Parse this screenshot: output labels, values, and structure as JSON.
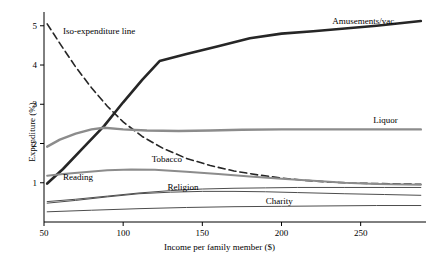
{
  "chart_data": {
    "type": "line",
    "title": "",
    "xlabel": "Income per family member ($)",
    "ylabel": "Expenditure (%)",
    "xlim": [
      50,
      290
    ],
    "ylim": [
      0,
      5.3
    ],
    "xticks": [
      50,
      100,
      150,
      200,
      250
    ],
    "yticks": [
      1,
      2,
      3,
      4,
      5
    ],
    "grid": false,
    "legend_position": "inline-annotations",
    "annotations": [
      {
        "text": "Iso-expenditure line",
        "x": 62,
        "y": 4.78
      },
      {
        "text": "Amusements/vac.",
        "x": 232,
        "y": 5.05
      },
      {
        "text": "Liquor",
        "x": 258,
        "y": 2.52
      },
      {
        "text": "Tobacco",
        "x": 118,
        "y": 1.52
      },
      {
        "text": "Reading",
        "x": 62,
        "y": 1.07
      },
      {
        "text": "Religion",
        "x": 128,
        "y": 0.82
      },
      {
        "text": "Charity",
        "x": 190,
        "y": 0.47
      }
    ],
    "series": [
      {
        "name": "Iso-expenditure line",
        "style": "dashed",
        "color": "#262626",
        "width": 1.6,
        "points": [
          [
            52,
            5.05
          ],
          [
            60,
            4.55
          ],
          [
            70,
            3.95
          ],
          [
            80,
            3.42
          ],
          [
            90,
            2.95
          ],
          [
            100,
            2.55
          ],
          [
            112,
            2.18
          ],
          [
            125,
            1.88
          ],
          [
            140,
            1.62
          ],
          [
            155,
            1.44
          ],
          [
            170,
            1.3
          ],
          [
            185,
            1.2
          ],
          [
            200,
            1.12
          ],
          [
            215,
            1.06
          ],
          [
            230,
            1.02
          ],
          [
            245,
            0.99
          ],
          [
            260,
            0.98
          ],
          [
            275,
            0.97
          ],
          [
            288,
            0.96
          ]
        ]
      },
      {
        "name": "Amusements/vac.",
        "style": "solid",
        "color": "#262626",
        "width": 2.6,
        "points": [
          [
            52,
            0.98
          ],
          [
            62,
            1.35
          ],
          [
            75,
            1.9
          ],
          [
            88,
            2.45
          ],
          [
            100,
            3.05
          ],
          [
            112,
            3.62
          ],
          [
            123,
            4.1
          ],
          [
            140,
            4.28
          ],
          [
            160,
            4.48
          ],
          [
            180,
            4.68
          ],
          [
            200,
            4.8
          ],
          [
            220,
            4.86
          ],
          [
            240,
            4.93
          ],
          [
            260,
            5.0
          ],
          [
            288,
            5.12
          ]
        ]
      },
      {
        "name": "Liquor",
        "style": "solid",
        "color": "#8c8c8c",
        "width": 2.4,
        "points": [
          [
            52,
            1.92
          ],
          [
            60,
            2.1
          ],
          [
            70,
            2.25
          ],
          [
            80,
            2.36
          ],
          [
            88,
            2.4
          ],
          [
            100,
            2.36
          ],
          [
            115,
            2.33
          ],
          [
            135,
            2.32
          ],
          [
            155,
            2.33
          ],
          [
            175,
            2.35
          ],
          [
            200,
            2.36
          ],
          [
            225,
            2.36
          ],
          [
            250,
            2.36
          ],
          [
            270,
            2.36
          ],
          [
            288,
            2.36
          ]
        ]
      },
      {
        "name": "Tobacco",
        "style": "solid",
        "color": "#8c8c8c",
        "width": 2.0,
        "points": [
          [
            52,
            1.18
          ],
          [
            62,
            1.22
          ],
          [
            75,
            1.27
          ],
          [
            90,
            1.32
          ],
          [
            105,
            1.34
          ],
          [
            120,
            1.33
          ],
          [
            140,
            1.28
          ],
          [
            160,
            1.22
          ],
          [
            180,
            1.16
          ],
          [
            200,
            1.1
          ],
          [
            220,
            1.05
          ],
          [
            240,
            1.0
          ],
          [
            260,
            0.97
          ],
          [
            288,
            0.95
          ]
        ]
      },
      {
        "name": "Reading",
        "style": "solid",
        "color": "#4d4d4d",
        "width": 1.0,
        "points": [
          [
            52,
            0.52
          ],
          [
            70,
            0.58
          ],
          [
            90,
            0.66
          ],
          [
            110,
            0.74
          ],
          [
            130,
            0.8
          ],
          [
            150,
            0.84
          ],
          [
            170,
            0.86
          ],
          [
            190,
            0.87
          ],
          [
            210,
            0.88
          ],
          [
            240,
            0.88
          ],
          [
            265,
            0.88
          ],
          [
            288,
            0.88
          ]
        ]
      },
      {
        "name": "Religion",
        "style": "solid",
        "color": "#4d4d4d",
        "width": 1.0,
        "points": [
          [
            52,
            0.48
          ],
          [
            70,
            0.55
          ],
          [
            90,
            0.64
          ],
          [
            110,
            0.72
          ],
          [
            130,
            0.76
          ],
          [
            150,
            0.78
          ],
          [
            170,
            0.78
          ],
          [
            190,
            0.77
          ],
          [
            210,
            0.75
          ],
          [
            240,
            0.72
          ],
          [
            265,
            0.7
          ],
          [
            288,
            0.68
          ]
        ]
      },
      {
        "name": "Charity",
        "style": "solid",
        "color": "#4d4d4d",
        "width": 1.0,
        "points": [
          [
            52,
            0.26
          ],
          [
            80,
            0.3
          ],
          [
            110,
            0.34
          ],
          [
            140,
            0.37
          ],
          [
            170,
            0.39
          ],
          [
            200,
            0.4
          ],
          [
            230,
            0.41
          ],
          [
            260,
            0.42
          ],
          [
            288,
            0.42
          ]
        ]
      }
    ]
  }
}
